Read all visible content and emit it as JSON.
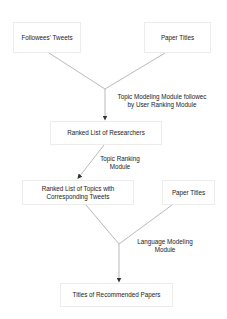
{
  "diagram": {
    "type": "flowchart",
    "nodes": {
      "followees_tweets": {
        "label": "Followees' Tweets"
      },
      "paper_titles_1": {
        "label": "Paper Titles"
      },
      "ranked_researchers": {
        "label": "Ranked List of Researchers"
      },
      "ranked_topics_line1": {
        "label": "Ranked List of Topics with"
      },
      "ranked_topics_line2": {
        "label": "Corresponding Tweets"
      },
      "paper_titles_2": {
        "label": "Paper Titles"
      },
      "recommended_papers": {
        "label": "Titles of Recommended Papers"
      }
    },
    "edge_labels": {
      "topic_modeling_line1": "Topic Modeling Module followec",
      "topic_modeling_line2": "by User Ranking Module",
      "topic_ranking_line1": "Topic Ranking",
      "topic_ranking_line2": "Module",
      "language_modeling_line1": "Language Modeling",
      "language_modeling_line2": "Module"
    },
    "edges": [
      {
        "from": "Followees' Tweets + Paper Titles",
        "to": "Ranked List of Researchers",
        "label": "Topic Modeling Module followed by User Ranking Module"
      },
      {
        "from": "Ranked List of Researchers",
        "to": "Ranked List of Topics with Corresponding Tweets",
        "label": "Topic Ranking Module"
      },
      {
        "from": "Ranked List of Topics with Corresponding Tweets + Paper Titles",
        "to": "Titles of Recommended Papers",
        "label": "Language Modeling Module"
      }
    ],
    "colors": {
      "line": "#8a8a8a",
      "arrow": "#333333",
      "box_border": "#ececec",
      "text": "#222222"
    }
  }
}
